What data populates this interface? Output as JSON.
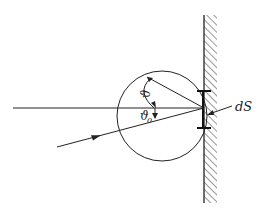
{
  "diagram": {
    "type": "physics-scattering-geometry",
    "labels": {
      "theta": "ϑ",
      "theta0": "ϑ",
      "theta0_sub": "0",
      "surface_element": "dS"
    },
    "colors": {
      "ink": "#222222",
      "background": "#ffffff"
    }
  }
}
